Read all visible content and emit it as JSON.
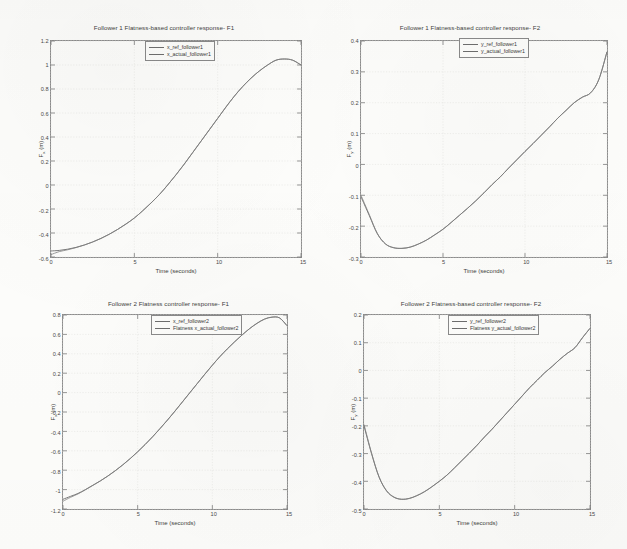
{
  "figure": {
    "background_color": "#fdfdfb",
    "line_color": "#6b6b6b",
    "axis_color": "#8c8c8c"
  },
  "chart_data": [
    {
      "type": "line",
      "id": "follower1-f1",
      "title": "Follower 1  Flatness-based controller response- F1",
      "xlabel": "Time (seconds)",
      "ylabel": "F",
      "ylabel_sub": "x",
      "ylabel_unit": "(m)",
      "xlim": [
        0,
        15
      ],
      "ylim": [
        -0.6,
        1.2
      ],
      "xticks": [
        0,
        5,
        10,
        15
      ],
      "yticks": [
        -0.6,
        -0.4,
        -0.2,
        0,
        0.2,
        0.4,
        0.6,
        0.8,
        1,
        1.2
      ],
      "xtick_labels": [
        "0",
        "5",
        "10",
        "15"
      ],
      "ytick_labels": [
        "-0.6",
        "-0.4",
        "-0.2",
        "0",
        "0.2",
        "0.4",
        "0.6",
        "0.8",
        "1",
        "1.2"
      ],
      "grid": true,
      "legend_position": "north",
      "legend": [
        "x_ref_follower1",
        "x_actual_follower1"
      ],
      "x": [
        0,
        0.5,
        1,
        1.5,
        2,
        2.5,
        3,
        3.5,
        4,
        4.5,
        5,
        5.5,
        6,
        6.5,
        7,
        7.5,
        8,
        8.5,
        9,
        9.5,
        10,
        10.5,
        11,
        11.5,
        12,
        12.5,
        13,
        13.5,
        14,
        14.5,
        15
      ],
      "series": [
        {
          "name": "x_ref_follower1",
          "values": [
            -0.55,
            -0.545,
            -0.535,
            -0.52,
            -0.5,
            -0.475,
            -0.445,
            -0.41,
            -0.37,
            -0.325,
            -0.275,
            -0.215,
            -0.15,
            -0.08,
            0.0,
            0.085,
            0.175,
            0.27,
            0.365,
            0.46,
            0.555,
            0.65,
            0.74,
            0.82,
            0.89,
            0.95,
            1.0,
            1.04,
            1.05,
            1.04,
            1.0
          ]
        },
        {
          "name": "x_actual_follower1",
          "values": [
            -0.58,
            -0.555,
            -0.54,
            -0.522,
            -0.5,
            -0.475,
            -0.445,
            -0.41,
            -0.37,
            -0.325,
            -0.275,
            -0.215,
            -0.15,
            -0.08,
            0.0,
            0.085,
            0.175,
            0.27,
            0.365,
            0.46,
            0.555,
            0.65,
            0.74,
            0.82,
            0.89,
            0.95,
            1.0,
            1.04,
            1.05,
            1.04,
            1.0
          ]
        }
      ]
    },
    {
      "type": "line",
      "id": "follower1-f2",
      "title": "Follower 1 Flatness-based controller response- F2",
      "xlabel": "Time (seconds)",
      "ylabel": "F",
      "ylabel_sub": "y",
      "ylabel_unit": "(m)",
      "xlim": [
        0,
        15
      ],
      "ylim": [
        -0.3,
        0.4
      ],
      "xticks": [
        0,
        5,
        10,
        15
      ],
      "yticks": [
        -0.3,
        -0.2,
        -0.1,
        0,
        0.1,
        0.2,
        0.3,
        0.4
      ],
      "xtick_labels": [
        "0",
        "5",
        "10",
        "15"
      ],
      "ytick_labels": [
        "-0.3",
        "-0.2",
        "-0.1",
        "0",
        "0.1",
        "0.2",
        "0.3",
        "0.4"
      ],
      "grid": true,
      "legend_position": "northeast",
      "legend": [
        "y_ref_follower1",
        "y_actual_follower1"
      ],
      "x": [
        0,
        0.5,
        1,
        1.5,
        2,
        2.5,
        3,
        3.5,
        4,
        4.5,
        5,
        5.5,
        6,
        6.5,
        7,
        7.5,
        8,
        8.5,
        9,
        9.5,
        10,
        10.5,
        11,
        11.5,
        12,
        12.5,
        13,
        13.5,
        14,
        14.5,
        15
      ],
      "series": [
        {
          "name": "y_ref_follower1",
          "values": [
            -0.105,
            -0.165,
            -0.225,
            -0.258,
            -0.27,
            -0.272,
            -0.268,
            -0.258,
            -0.245,
            -0.228,
            -0.21,
            -0.188,
            -0.165,
            -0.142,
            -0.118,
            -0.092,
            -0.065,
            -0.04,
            -0.012,
            0.015,
            0.042,
            0.068,
            0.095,
            0.122,
            0.15,
            0.175,
            0.2,
            0.218,
            0.232,
            0.275,
            0.365
          ]
        },
        {
          "name": "y_actual_follower1",
          "values": [
            -0.1,
            -0.162,
            -0.224,
            -0.258,
            -0.27,
            -0.272,
            -0.268,
            -0.258,
            -0.245,
            -0.228,
            -0.21,
            -0.188,
            -0.165,
            -0.142,
            -0.118,
            -0.092,
            -0.065,
            -0.04,
            -0.012,
            0.015,
            0.042,
            0.068,
            0.095,
            0.122,
            0.15,
            0.175,
            0.2,
            0.218,
            0.232,
            0.275,
            0.365
          ]
        }
      ]
    },
    {
      "type": "line",
      "id": "follower2-f1",
      "title": "Follower 2 Flatness controller response- F1",
      "xlabel": "Time (seconds)",
      "ylabel": "F",
      "ylabel_sub": "x",
      "ylabel_unit": "(m)",
      "xlim": [
        0,
        15
      ],
      "ylim": [
        -1.2,
        0.8
      ],
      "xticks": [
        0,
        5,
        10,
        15
      ],
      "yticks": [
        -1.2,
        -1,
        -0.8,
        -0.6,
        -0.4,
        -0.2,
        0,
        0.2,
        0.4,
        0.6,
        0.8
      ],
      "xtick_labels": [
        "0",
        "5",
        "10",
        "15"
      ],
      "ytick_labels": [
        "-1.2",
        "-1",
        "-0.8",
        "-0.6",
        "-0.4",
        "-0.2",
        "0",
        "0.2",
        "0.4",
        "0.6",
        "0.8"
      ],
      "grid": true,
      "legend_position": "north",
      "legend": [
        "x_ref_follower2",
        "Flatness x_actual_follower2"
      ],
      "x": [
        0,
        0.5,
        1,
        1.5,
        2,
        2.5,
        3,
        3.5,
        4,
        4.5,
        5,
        5.5,
        6,
        6.5,
        7,
        7.5,
        8,
        8.5,
        9,
        9.5,
        10,
        10.5,
        11,
        11.5,
        12,
        12.5,
        13,
        13.5,
        14,
        14.5,
        15
      ],
      "series": [
        {
          "name": "x_ref_follower2",
          "values": [
            -1.1,
            -1.07,
            -1.04,
            -1.0,
            -0.955,
            -0.91,
            -0.86,
            -0.805,
            -0.745,
            -0.68,
            -0.61,
            -0.535,
            -0.455,
            -0.37,
            -0.282,
            -0.19,
            -0.095,
            0.0,
            0.095,
            0.19,
            0.282,
            0.37,
            0.45,
            0.525,
            0.595,
            0.66,
            0.715,
            0.758,
            0.778,
            0.77,
            0.69
          ]
        },
        {
          "name": "Flatness x_actual_follower2",
          "values": [
            -1.12,
            -1.08,
            -1.045,
            -1.002,
            -0.957,
            -0.911,
            -0.861,
            -0.806,
            -0.746,
            -0.681,
            -0.611,
            -0.536,
            -0.456,
            -0.371,
            -0.283,
            -0.191,
            -0.096,
            0.0,
            0.095,
            0.19,
            0.282,
            0.37,
            0.45,
            0.525,
            0.595,
            0.66,
            0.715,
            0.758,
            0.778,
            0.77,
            0.69
          ]
        }
      ]
    },
    {
      "type": "line",
      "id": "follower2-f2",
      "title": "Follower 2 Flatness-based controller response- F2",
      "xlabel": "Time (seconds)",
      "ylabel": "F",
      "ylabel_sub": "y",
      "ylabel_unit": "(m)",
      "xlim": [
        0,
        15
      ],
      "ylim": [
        -0.5,
        0.2
      ],
      "xticks": [
        0,
        5,
        10,
        15
      ],
      "yticks": [
        -0.5,
        -0.4,
        -0.3,
        -0.2,
        -0.1,
        0,
        0.1,
        0.2
      ],
      "xtick_labels": [
        "0",
        "5",
        "10",
        "15"
      ],
      "ytick_labels": [
        "-0.5",
        "-0.4",
        "-0.3",
        "-0.2",
        "-0.1",
        "0",
        "0.1",
        "0.2"
      ],
      "grid": true,
      "legend_position": "north",
      "legend": [
        "y_ref_follower2",
        "Flatness y_actual_follower2"
      ],
      "x": [
        0,
        0.5,
        1,
        1.5,
        2,
        2.5,
        3,
        3.5,
        4,
        4.5,
        5,
        5.5,
        6,
        6.5,
        7,
        7.5,
        8,
        8.5,
        9,
        9.5,
        10,
        10.5,
        11,
        11.5,
        12,
        12.5,
        13,
        13.5,
        14,
        14.5,
        15
      ],
      "series": [
        {
          "name": "y_ref_follower2",
          "values": [
            -0.2,
            -0.3,
            -0.385,
            -0.435,
            -0.458,
            -0.465,
            -0.462,
            -0.452,
            -0.438,
            -0.42,
            -0.4,
            -0.378,
            -0.352,
            -0.325,
            -0.298,
            -0.27,
            -0.24,
            -0.212,
            -0.182,
            -0.152,
            -0.122,
            -0.092,
            -0.062,
            -0.035,
            -0.008,
            0.015,
            0.04,
            0.062,
            0.082,
            0.118,
            0.152
          ]
        },
        {
          "name": "Flatness y_actual_follower2",
          "values": [
            -0.195,
            -0.298,
            -0.384,
            -0.434,
            -0.457,
            -0.465,
            -0.462,
            -0.452,
            -0.438,
            -0.42,
            -0.4,
            -0.378,
            -0.352,
            -0.325,
            -0.298,
            -0.27,
            -0.24,
            -0.212,
            -0.182,
            -0.152,
            -0.122,
            -0.092,
            -0.062,
            -0.035,
            -0.008,
            0.015,
            0.04,
            0.062,
            0.082,
            0.118,
            0.152
          ]
        }
      ]
    }
  ]
}
